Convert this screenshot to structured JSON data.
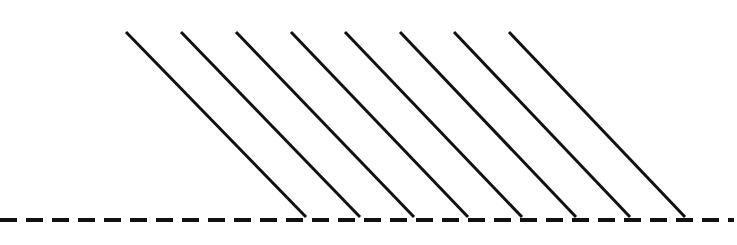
{
  "figure": {
    "canvas": {
      "width": 737,
      "height": 245,
      "background_color": "#ffffff"
    },
    "baseline": {
      "name": "dashed-horizontal-baseline",
      "color": "#111111",
      "stroke_width": 4,
      "y": 220,
      "x_start": 0,
      "x_end": 734,
      "dash_length": 17,
      "gap_length": 9,
      "dash_pattern": "17 9"
    },
    "hatch": {
      "name": "diagonal-hatch-lines",
      "count": 8,
      "color": "#111111",
      "stroke_width": 3,
      "top_y": 32,
      "bottom_y": 217,
      "spacing_x": 55,
      "slope_dx": 180,
      "lines": [
        {
          "label": "hatch-line-1",
          "x1": 126,
          "y1": 32,
          "x2": 306,
          "y2": 217
        },
        {
          "label": "hatch-line-2",
          "x1": 181,
          "y1": 32,
          "x2": 360,
          "y2": 217
        },
        {
          "label": "hatch-line-3",
          "x1": 236,
          "y1": 32,
          "x2": 414,
          "y2": 217
        },
        {
          "label": "hatch-line-4",
          "x1": 291,
          "y1": 32,
          "x2": 468,
          "y2": 217
        },
        {
          "label": "hatch-line-5",
          "x1": 345,
          "y1": 32,
          "x2": 522,
          "y2": 217
        },
        {
          "label": "hatch-line-6",
          "x1": 400,
          "y1": 32,
          "x2": 576,
          "y2": 217
        },
        {
          "label": "hatch-line-7",
          "x1": 454,
          "y1": 32,
          "x2": 630,
          "y2": 217
        },
        {
          "label": "hatch-line-8",
          "x1": 509,
          "y1": 32,
          "x2": 685,
          "y2": 217
        }
      ]
    }
  },
  "chart_data": {
    "type": "line",
    "xlabel": "",
    "ylabel": "",
    "xlim": [
      0,
      737
    ],
    "ylim": [
      245,
      0
    ],
    "grid": false,
    "legend": "none",
    "series": [
      {
        "name": "hatch-line-1",
        "x": [
          126,
          306
        ],
        "y": [
          32,
          217
        ]
      },
      {
        "name": "hatch-line-2",
        "x": [
          181,
          360
        ],
        "y": [
          32,
          217
        ]
      },
      {
        "name": "hatch-line-3",
        "x": [
          236,
          414
        ],
        "y": [
          32,
          217
        ]
      },
      {
        "name": "hatch-line-4",
        "x": [
          291,
          468
        ],
        "y": [
          32,
          217
        ]
      },
      {
        "name": "hatch-line-5",
        "x": [
          345,
          522
        ],
        "y": [
          32,
          217
        ]
      },
      {
        "name": "hatch-line-6",
        "x": [
          400,
          576
        ],
        "y": [
          32,
          217
        ]
      },
      {
        "name": "hatch-line-7",
        "x": [
          454,
          630
        ],
        "y": [
          32,
          217
        ]
      },
      {
        "name": "hatch-line-8",
        "x": [
          509,
          685
        ],
        "y": [
          32,
          217
        ]
      },
      {
        "name": "dashed-baseline",
        "x": [
          0,
          734
        ],
        "y": [
          220,
          220
        ]
      }
    ]
  }
}
